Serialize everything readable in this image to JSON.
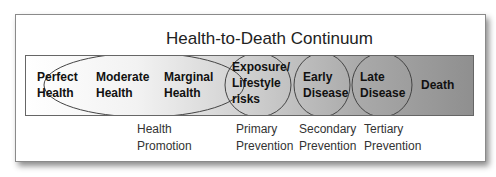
{
  "title": "Health-to-Death Continuum",
  "stages": [
    {
      "line1": "Perfect",
      "line2": "Health"
    },
    {
      "line1": "Moderate",
      "line2": "Health"
    },
    {
      "line1": "Marginal",
      "line2": "Health"
    },
    {
      "line1": "Exposure/",
      "line2": "Lifestyle",
      "line3": "risks"
    },
    {
      "line1": "Early",
      "line2": "Disease"
    },
    {
      "line1": "Late",
      "line2": "Disease"
    },
    {
      "line1": "Death"
    }
  ],
  "prevention": [
    {
      "line1": "Health",
      "line2": "Promotion"
    },
    {
      "line1": "Primary",
      "line2": "Prevention"
    },
    {
      "line1": "Secondary",
      "line2": "Prevention"
    },
    {
      "line1": "Tertiary",
      "line2": "Prevention"
    }
  ]
}
